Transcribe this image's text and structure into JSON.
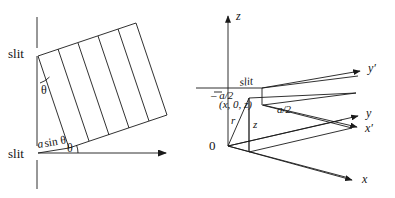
{
  "figure": {
    "stroke_color": "#1a1a1a",
    "background_color": "#ffffff",
    "text_color": "#141414"
  },
  "left_diagram": {
    "name": "grating-path-difference-diagram",
    "labels": {
      "slit_top": "slit",
      "slit_bottom": "slit",
      "theta_top": "θ",
      "theta_bottom": "θ",
      "path_difference": "a sin θ",
      "path_difference_italic_part": "a",
      "path_difference_roman_part": "sin θ"
    },
    "elements": {
      "vertical_screen_top": "vertical-line-top",
      "vertical_screen_bottom": "vertical-line-bottom",
      "wavefront_count": 5,
      "ray_arrow": "horizontal-ray-arrow"
    }
  },
  "right_diagram": {
    "name": "3d-slit-coordinate-diagram",
    "axes": [
      {
        "id": "z",
        "label": "z",
        "direction": "up"
      },
      {
        "id": "x",
        "label": "x",
        "direction": "lower-right"
      },
      {
        "id": "y",
        "label": "y",
        "direction": "right"
      },
      {
        "id": "x-prime",
        "label": "x′",
        "direction": "right"
      },
      {
        "id": "y-prime",
        "label": "y′",
        "direction": "upper-right"
      }
    ],
    "labels": {
      "origin": "0",
      "slit": "slit",
      "minus_a_over_2": "– a/2",
      "a_over_2": "a/2",
      "point_coords": "(x, 0, z)",
      "radius": "r",
      "height": "z"
    }
  }
}
